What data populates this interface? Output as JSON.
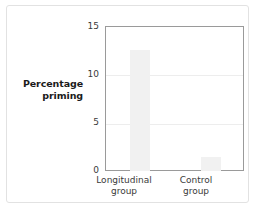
{
  "chart_data": {
    "type": "bar",
    "title": "",
    "xlabel": "",
    "ylabel": "Percentage priming",
    "ylabel_line1": "Percentage",
    "ylabel_line2": "priming",
    "categories": [
      "Longitudinal group",
      "Control group"
    ],
    "category_lines": [
      {
        "line1": "Longitudinal",
        "line2": "group"
      },
      {
        "line1": "Control",
        "line2": "group"
      }
    ],
    "values": [
      12.5,
      1.5
    ],
    "ylim": [
      0,
      15
    ],
    "yticks": [
      0,
      5,
      10,
      15
    ],
    "ytick_labels": [
      "0",
      "5",
      "10",
      "15"
    ],
    "grid": true,
    "grid_values": [
      5,
      10
    ],
    "legend": "none",
    "bar_color": "#f1f1f1",
    "frame_color": "#9a9a9a",
    "grid_color": "#ededed",
    "text_color": "#3a3a3a"
  }
}
